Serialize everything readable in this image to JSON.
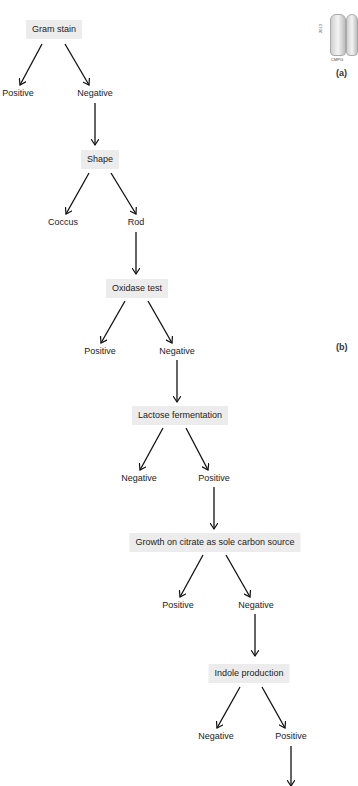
{
  "figure": {
    "panel_labels": [
      "(a)",
      "(b)"
    ],
    "photo_caption": "CMPG",
    "photo_side_text": "2013"
  },
  "flowchart": {
    "nodes": [
      {
        "id": "gram",
        "label": "Gram stain",
        "children": [
          "Positive",
          "Negative"
        ],
        "continues": "Negative"
      },
      {
        "id": "shape",
        "label": "Shape",
        "children": [
          "Coccus",
          "Rod"
        ],
        "continues": "Rod"
      },
      {
        "id": "oxidase",
        "label": "Oxidase test",
        "children": [
          "Positive",
          "Negative"
        ],
        "continues": "Negative"
      },
      {
        "id": "lactose",
        "label": "Lactose fermentation",
        "children": [
          "Negative",
          "Positive"
        ],
        "continues": "Positive"
      },
      {
        "id": "citrate",
        "label": "Growth on citrate as sole carbon source",
        "children": [
          "Positive",
          "Negative"
        ],
        "continues": "Negative"
      },
      {
        "id": "indole",
        "label": "Indole production",
        "children": [
          "Negative",
          "Positive"
        ],
        "continues": "Positive"
      }
    ]
  }
}
